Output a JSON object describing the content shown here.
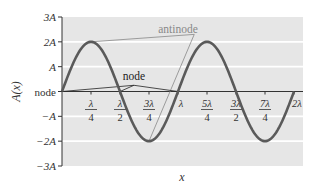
{
  "chart_data": {
    "type": "line",
    "title": "",
    "xlabel": "x",
    "ylabel": "A(x)",
    "function": "A(x) = 2A·sin(2πx/λ)",
    "amplitude_in_A": 2,
    "x_range_in_lambda": [
      0,
      2.1
    ],
    "ylim_in_A": [
      -3,
      3
    ],
    "grid": "horizontal",
    "x_ticks": [
      {
        "value": 0.25,
        "num": "λ",
        "den": "4"
      },
      {
        "value": 0.5,
        "num": "λ",
        "den": "2"
      },
      {
        "value": 0.75,
        "num": "3λ",
        "den": "4"
      },
      {
        "value": 1.0,
        "num": "λ",
        "den": ""
      },
      {
        "value": 1.25,
        "num": "5λ",
        "den": "4"
      },
      {
        "value": 1.5,
        "num": "3λ",
        "den": "2"
      },
      {
        "value": 1.75,
        "num": "7λ",
        "den": "4"
      },
      {
        "value": 2.0,
        "num": "2λ",
        "den": ""
      }
    ],
    "y_ticks": [
      {
        "value": 3,
        "label": "3A"
      },
      {
        "value": 2,
        "label": "2A"
      },
      {
        "value": 1,
        "label": "A"
      },
      {
        "value": 0,
        "label": "node"
      },
      {
        "value": -1,
        "label": "−A"
      },
      {
        "value": -2,
        "label": "−2A"
      },
      {
        "value": -3,
        "label": "−3A"
      }
    ],
    "series": [
      {
        "name": "standing wave",
        "x_in_lambda_from": 0,
        "x_in_lambda_to": 2,
        "color": "#5a5a5a"
      }
    ],
    "annotations": [
      {
        "label": "antinode",
        "color": "#888888",
        "points": [
          [
            0.25,
            2
          ],
          [
            0.75,
            -2
          ]
        ],
        "text_anchor": [
          1.05,
          2.4
        ]
      },
      {
        "label": "node",
        "color": "#222222",
        "points": [
          [
            0,
            0
          ],
          [
            0.5,
            0
          ],
          [
            1.0,
            0
          ]
        ],
        "text_anchor": [
          0.62,
          0.55
        ]
      }
    ],
    "colors": {
      "plot_background": "#e6e6e6",
      "gridline": "#ffffff",
      "axis": "#333333",
      "curve": "#5a5a5a"
    }
  }
}
